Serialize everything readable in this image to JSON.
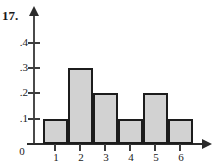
{
  "problem": {
    "number_label": "17."
  },
  "chart_data": {
    "type": "bar",
    "title": "",
    "subtitle": "",
    "xlabel": "",
    "ylabel": "",
    "categories": [
      "1",
      "2",
      "3",
      "4",
      "5",
      "6"
    ],
    "values": [
      0.1,
      0.3,
      0.2,
      0.1,
      0.2,
      0.1
    ],
    "value_labels": [
      ".1",
      ".3",
      ".2",
      ".1",
      ".2",
      ".1"
    ],
    "xlim": [
      0.4,
      6.8
    ],
    "ylim": [
      0,
      0.47
    ],
    "x_tick_labels": [
      "1",
      "2",
      "3",
      "4",
      "5",
      "6"
    ],
    "x_tick_values": [
      1,
      2,
      3,
      4,
      5,
      6
    ],
    "y_tick_labels": [
      ".1",
      ".2",
      ".3",
      ".4"
    ],
    "y_tick_values": [
      0.1,
      0.2,
      0.3,
      0.4
    ],
    "origin_label": "0",
    "grid": false,
    "legend": null,
    "legend_position": "none",
    "bar_width_units": 1.0,
    "colors": {
      "bar_fill": "#d2d2d2",
      "bar_outline": "#1c1c1c",
      "axis": "#2b2b2b",
      "text": "#1a1a1a"
    },
    "annotations": []
  }
}
